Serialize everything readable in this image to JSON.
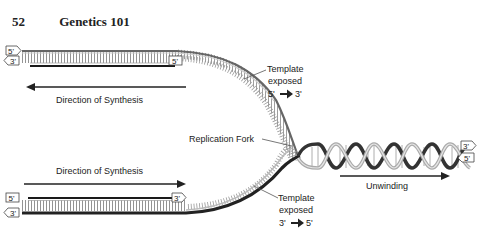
{
  "header": {
    "page_number": "52",
    "title": "Genetics 101"
  },
  "diagram": {
    "labels": {
      "direction_top": "Direction of Synthesis",
      "direction_bottom": "Direction of Synthesis",
      "replication_fork": "Replication Fork",
      "unwinding": "Unwinding",
      "template_top_line1": "Template",
      "template_top_line2": "exposed",
      "template_top_from": "5'",
      "template_top_to": "3'",
      "template_bottom_line1": "Template",
      "template_bottom_line2": "exposed",
      "template_bottom_from": "3'",
      "template_bottom_to": "5'"
    },
    "strand_ends": {
      "top_upper_left": "5'",
      "top_lower_left": "3'",
      "top_lower_right": "5'",
      "bottom_upper_left": "5'",
      "bottom_upper_right": "3'",
      "bottom_lower_left": "3'",
      "helix_upper_right": "3'",
      "helix_lower_right": "5'"
    },
    "colors": {
      "strand": "#555555",
      "strand_light": "#bbbbbb",
      "new_strand": "#222222",
      "text": "#222222"
    }
  }
}
